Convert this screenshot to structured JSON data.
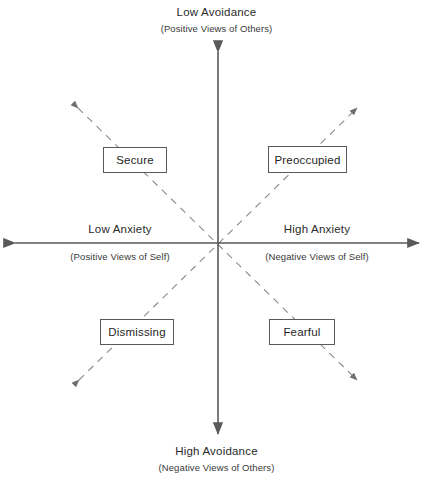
{
  "diagram": {
    "colors": {
      "axis": "#595959",
      "diagonal": "#8a8a8a",
      "box_border": "#595959",
      "text": "#1f1f1f",
      "background": "#ffffff"
    },
    "axes": {
      "vertical": {
        "name": "Avoidance",
        "top": {
          "main": "Low Avoidance",
          "sub": "(Positive Views of Others)"
        },
        "bottom": {
          "main": "High Avoidance",
          "sub": "(Negative Views of Others)"
        }
      },
      "horizontal": {
        "name": "Anxiety",
        "left": {
          "main": "Low Anxiety",
          "sub": "(Positive Views of Self)"
        },
        "right": {
          "main": "High Anxiety",
          "sub": "(Negative Views of Self)"
        }
      }
    },
    "quadrants": [
      {
        "id": "secure",
        "label": "Secure",
        "position": "top-left"
      },
      {
        "id": "preoccupied",
        "label": "Preoccupied",
        "position": "top-right"
      },
      {
        "id": "dismissing",
        "label": "Dismissing",
        "position": "bottom-left"
      },
      {
        "id": "fearful",
        "label": "Fearful",
        "position": "bottom-right"
      }
    ],
    "diagonals": [
      {
        "id": "secure-fearful",
        "from": "top-left",
        "to": "bottom-right",
        "style": "dashed",
        "arrowheads": "both"
      },
      {
        "id": "dismissing-preoccupied",
        "from": "bottom-left",
        "to": "top-right",
        "style": "dashed",
        "arrowheads": "both"
      }
    ]
  }
}
